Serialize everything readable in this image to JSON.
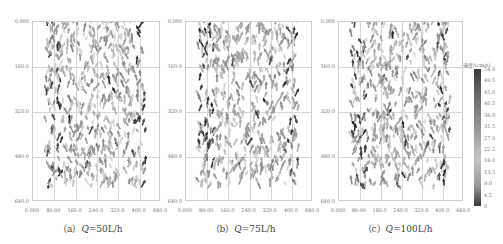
{
  "chart_data": {
    "type": "scatter",
    "subtype": "vector-field",
    "title": "",
    "panels": [
      {
        "id": "a",
        "caption_prefix": "（a）",
        "caption_var": "Q",
        "caption_value": "=50L/h",
        "x_ticks": [
          "0.000",
          "80.00",
          "160.0",
          "240.0",
          "320.0",
          "400.0",
          "480.0"
        ],
        "y_ticks": [
          "0.000",
          "160.0",
          "320.0",
          "480.0",
          "640.0"
        ],
        "xlim": [
          0,
          480
        ],
        "ylim": [
          640,
          0
        ]
      },
      {
        "id": "b",
        "caption_prefix": "（b）",
        "caption_var": "Q",
        "caption_value": "=75L/h",
        "x_ticks": [
          "0.000",
          "80.00",
          "160.0",
          "240.0",
          "320.0",
          "400.0",
          "480.0"
        ],
        "y_ticks": [
          "0.000",
          "160.0",
          "320.0",
          "480.0",
          "640.0"
        ],
        "xlim": [
          0,
          480
        ],
        "ylim": [
          640,
          0
        ]
      },
      {
        "id": "c",
        "caption_prefix": "（c）",
        "caption_var": "Q",
        "caption_value": "=100L/h",
        "x_ticks": [
          "0.000",
          "80.00",
          "160.0",
          "240.0",
          "320.0",
          "400.0",
          "480.0"
        ],
        "y_ticks": [
          "0.000",
          "160.0",
          "320.0",
          "480.0",
          "640.0"
        ],
        "xlim": [
          0,
          480
        ],
        "ylim": [
          640,
          0
        ]
      }
    ],
    "colorbar": {
      "title": "速度/(cm/s)",
      "labels": [
        "54.0",
        "49.5",
        "45.0",
        "40.5",
        "36.0",
        "31.5",
        "27.0",
        "22.5",
        "18.0",
        "13.5",
        "9.0",
        "4.5",
        "0"
      ],
      "range": [
        0,
        54.0
      ]
    },
    "grid": true,
    "legend_position": "right"
  }
}
